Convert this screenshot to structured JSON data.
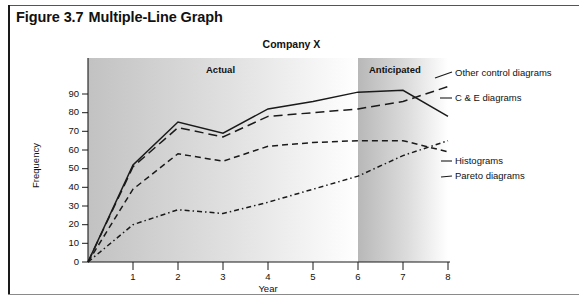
{
  "figure": {
    "number": "Figure 3.7",
    "caption": "Multiple-Line Graph"
  },
  "chart_data": {
    "type": "line",
    "title": "Company X",
    "xlabel": "Year",
    "ylabel": "Frequency",
    "xlim": [
      0,
      8
    ],
    "ylim": [
      0,
      95
    ],
    "x_ticks": [
      0,
      1,
      2,
      3,
      4,
      5,
      6,
      7,
      8
    ],
    "x_tick_labels": [
      "",
      "1",
      "2",
      "3",
      "4",
      "5",
      "6",
      "7",
      "8"
    ],
    "y_ticks": [
      0,
      10,
      20,
      30,
      40,
      50,
      60,
      70,
      80,
      90
    ],
    "y_tick_labels": [
      "0",
      "10",
      "20",
      "30",
      "40",
      "50",
      "60",
      "70",
      "80",
      "90"
    ],
    "grid": false,
    "legend_position": "right-inline",
    "x": [
      0,
      1,
      2,
      3,
      4,
      5,
      6,
      7,
      8
    ],
    "series": [
      {
        "name": "Other control diagrams",
        "style": "solid",
        "color": "#1a1a1a",
        "values": [
          0,
          52,
          75,
          69,
          82,
          86,
          91,
          92,
          78
        ]
      },
      {
        "name": "C & E diagrams",
        "style": "long-dash",
        "color": "#1a1a1a",
        "values": [
          0,
          51,
          72,
          67,
          78,
          80,
          82,
          86,
          94
        ]
      },
      {
        "name": "Histograms",
        "style": "dashed",
        "color": "#1a1a1a",
        "values": [
          0,
          39,
          58,
          54,
          62,
          64,
          65,
          65,
          59
        ]
      },
      {
        "name": "Pareto diagrams",
        "style": "dash-dot",
        "color": "#1a1a1a",
        "values": [
          0,
          20,
          28,
          26,
          32,
          39,
          46,
          57,
          65
        ]
      }
    ],
    "zones": [
      {
        "label": "Actual",
        "x_start": 0,
        "x_end": 6
      },
      {
        "label": "Anticipated",
        "x_start": 6,
        "x_end": 8
      }
    ],
    "annotations": [
      {
        "text": "Other control diagrams",
        "series": "Other control diagrams"
      },
      {
        "text": "C & E diagrams",
        "series": "C & E diagrams"
      },
      {
        "text": "Histograms",
        "series": "Histograms"
      },
      {
        "text": "Pareto diagrams",
        "series": "Pareto diagrams"
      }
    ]
  }
}
